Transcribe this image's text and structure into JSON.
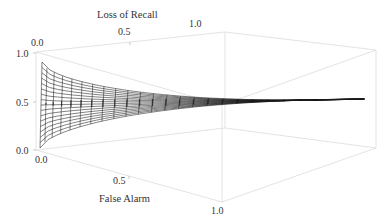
{
  "chart_data": {
    "type": "surface3d",
    "title": "",
    "axes": {
      "x": {
        "label": "False Alarm",
        "range": [
          0.0,
          1.0
        ],
        "ticks": [
          "0.0",
          "0.5",
          "1.0"
        ]
      },
      "y": {
        "label": "Loss of Recall",
        "range": [
          0.0,
          1.0
        ],
        "ticks": [
          "0.0",
          "0.5",
          "1.0"
        ]
      },
      "z": {
        "label": "",
        "range": [
          0.0,
          1.0
        ],
        "ticks": [
          "0.0",
          "0.5",
          "1.0"
        ]
      }
    },
    "surface": {
      "style": "wireframe mesh",
      "description": "At False Alarm = 0, the surface spans the full range z = 0.0 to 1.0 across Loss of Recall. As False Alarm increases toward 1.0, the mesh lines converge to a single value of about 0.5.",
      "edge_at_false_alarm_0": {
        "z_min": 0.0,
        "z_max": 1.0
      },
      "converged_value_at_false_alarm_1": 0.5,
      "mesh_color": "#000000"
    },
    "box": {
      "visible": true,
      "edge_color": "#d9d9d9"
    },
    "grid": false,
    "legend": null
  },
  "labels": {
    "loss_of_recall_title": "Loss of Recall",
    "false_alarm_title": "False Alarm",
    "y_tick_0": "0.0",
    "y_tick_05": "0.5",
    "y_tick_1": "1.0",
    "x_tick_0": "0.0",
    "x_tick_05": "0.5",
    "x_tick_1": "1.0",
    "z_tick_0": "0.0",
    "z_tick_05": "0.5",
    "z_tick_1": "1.0"
  }
}
